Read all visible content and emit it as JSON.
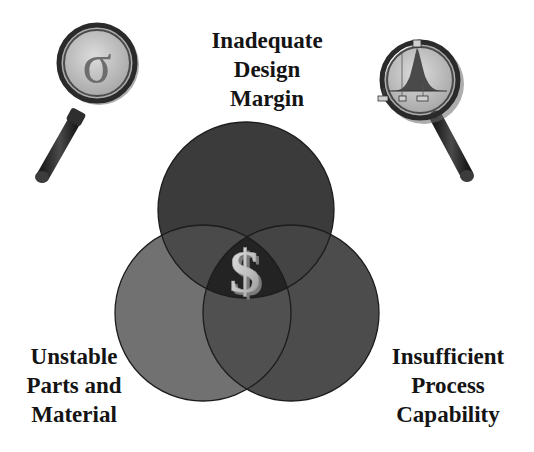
{
  "diagram": {
    "type": "venn",
    "sets": [
      {
        "id": "design",
        "position": "top",
        "label_lines": [
          "Inadequate",
          "Design",
          "Margin"
        ],
        "fill": "#3a3a3a"
      },
      {
        "id": "parts",
        "position": "bottom-left",
        "label_lines": [
          "Unstable",
          "Parts and",
          "Material"
        ],
        "fill": "#6e6e6e"
      },
      {
        "id": "process",
        "position": "bottom-right",
        "label_lines": [
          "Insufficient",
          "Process",
          "Capability"
        ],
        "fill": "#4a4a4a"
      }
    ],
    "center_symbol": "$",
    "center_symbol_name": "dollar-sign-icon",
    "icons": {
      "left_magnifier": {
        "name": "magnifying-glass-sigma-icon",
        "glyph": "σ"
      },
      "right_magnifier": {
        "name": "magnifying-glass-bell-curve-icon"
      }
    }
  }
}
